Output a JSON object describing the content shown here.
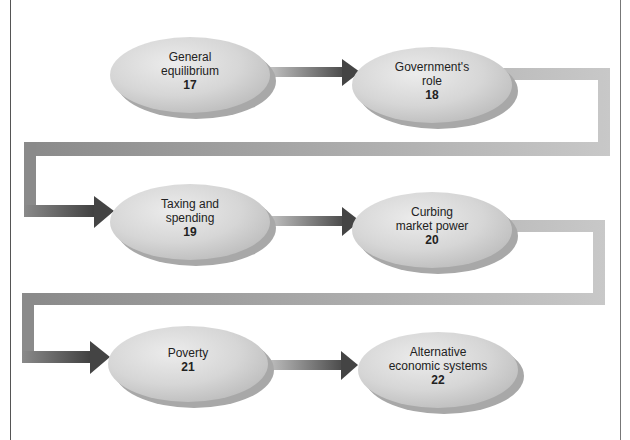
{
  "diagram": {
    "type": "flowchart",
    "nodes": [
      {
        "id": "n17",
        "title": "General equilibrium",
        "lines": [
          "General",
          "equilibrium"
        ],
        "chapter": "17"
      },
      {
        "id": "n18",
        "title": "Government's role",
        "lines": [
          "Government's",
          "role"
        ],
        "chapter": "18"
      },
      {
        "id": "n19",
        "title": "Taxing and spending",
        "lines": [
          "Taxing and",
          "spending"
        ],
        "chapter": "19"
      },
      {
        "id": "n20",
        "title": "Curbing market power",
        "lines": [
          "Curbing",
          "market power"
        ],
        "chapter": "20"
      },
      {
        "id": "n21",
        "title": "Poverty",
        "lines": [
          "Poverty"
        ],
        "chapter": "21"
      },
      {
        "id": "n22",
        "title": "Alternative economic systems",
        "lines": [
          "Alternative",
          "economic systems"
        ],
        "chapter": "22"
      }
    ],
    "edges": [
      {
        "from": "n17",
        "to": "n18"
      },
      {
        "from": "n18",
        "to": "n19"
      },
      {
        "from": "n19",
        "to": "n20"
      },
      {
        "from": "n20",
        "to": "n21"
      },
      {
        "from": "n21",
        "to": "n22"
      }
    ],
    "colors": {
      "oval_fill": "#d9d9d9",
      "oval_shadow": "#a8a8a8",
      "arrow_dark": "#555555",
      "arrow_light": "#bdbdbd",
      "text": "#222222"
    }
  }
}
